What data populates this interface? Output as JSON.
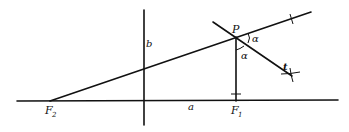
{
  "diagram": {
    "type": "ellipse-reflection-property",
    "labels": {
      "focus_left": "F",
      "focus_left_sub": "2",
      "focus_right": "F",
      "focus_right_sub": "1",
      "point": "P",
      "angle_upper": "α",
      "angle_lower": "α",
      "tangent": "t",
      "semi_major": "a",
      "semi_minor": "b"
    },
    "points": {
      "F2": [
        50,
        101
      ],
      "F1": [
        236,
        101
      ],
      "P": [
        236,
        37
      ],
      "origin": [
        144,
        101
      ]
    },
    "colors": {
      "ink": "#111111",
      "background": "#ffffff"
    }
  }
}
